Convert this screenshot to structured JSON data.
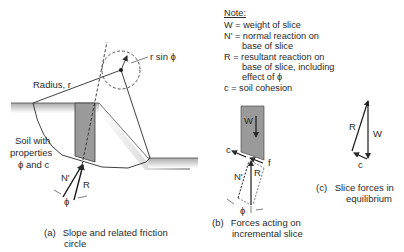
{
  "note": {
    "header": "Note:",
    "lines": [
      {
        "text": "W = weight of slice"
      },
      {
        "text": "N' = normal reaction on"
      },
      {
        "text": "base of slice",
        "indent": true
      },
      {
        "text": " R = resultant reaction on"
      },
      {
        "text": "base of slice, including",
        "indent": true
      },
      {
        "text": "effect of ϕ",
        "indent": true
      },
      {
        "text": " c = soil cohesion"
      }
    ]
  },
  "panel_a": {
    "labels": {
      "radius": "Radius, r",
      "r_sin_phi": "r sin ϕ",
      "soil_line1": "Soil with",
      "soil_line2": "properties",
      "soil_line3": "ϕ and c",
      "N": "N'",
      "R": "R",
      "phi": "ϕ"
    },
    "caption_label": "(a)",
    "caption_line1": "Slope and related friction",
    "caption_line2": "circle"
  },
  "panel_b": {
    "labels": {
      "W": "W",
      "c": "c",
      "f": "f",
      "N": "N'",
      "R": "R",
      "phi": "ϕ"
    },
    "caption_label": "(b)",
    "caption_line1": "Forces acting on",
    "caption_line2": "incremental slice"
  },
  "panel_c": {
    "labels": {
      "R": "R",
      "W": "W",
      "c": "c"
    },
    "caption_label": "(c)",
    "caption_line1": "Slice forces in",
    "caption_line2": "equilibrium"
  },
  "colors": {
    "ink": "#2a2a2a",
    "slice_fill": "#9a9a9a",
    "ground_fill": "#b8b8b8"
  }
}
